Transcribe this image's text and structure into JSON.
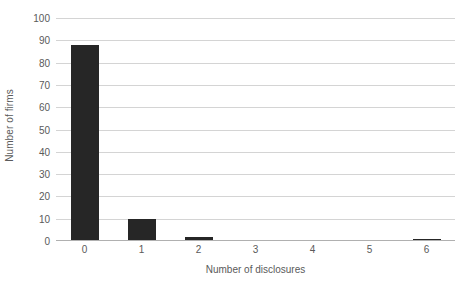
{
  "chart_data": {
    "type": "bar",
    "title": "",
    "subtitle": "",
    "xlabel": "Number of disclosures",
    "ylabel": "Number of firms",
    "categories": [
      "0",
      "1",
      "2",
      "3",
      "4",
      "5",
      "6"
    ],
    "values": [
      88,
      10,
      2,
      0,
      0,
      0,
      1
    ],
    "series": [
      {
        "name": "Number of firms",
        "values": [
          88,
          10,
          2,
          0,
          0,
          0,
          1
        ]
      }
    ],
    "ylim": [
      0,
      100
    ],
    "ytick_labels": [
      "100",
      "90",
      "80",
      "70",
      "60",
      "50",
      "40",
      "30",
      "20",
      "10",
      "0"
    ],
    "ytick_values": [
      100,
      90,
      80,
      70,
      60,
      50,
      40,
      30,
      20,
      10,
      0
    ],
    "ytick_step": 10,
    "xtick_labels": [
      "0",
      "1",
      "2",
      "3",
      "4",
      "5",
      "6"
    ],
    "grid": "horizontal",
    "legend": "none",
    "legend_position": "",
    "annotations": [],
    "colors": {
      "bar": "#262626",
      "gridline": "#d4d4d4",
      "axis": "#b0b0b0",
      "text": "#5a5a5a",
      "background": "#ffffff"
    }
  }
}
